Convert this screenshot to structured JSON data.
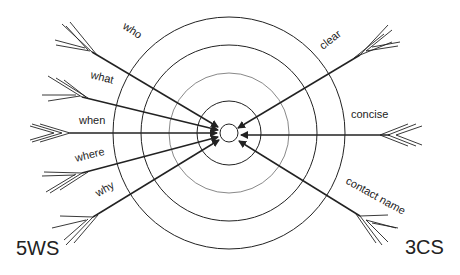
{
  "diagram": {
    "left_group_label": "5WS",
    "right_group_label": "3CS",
    "left_arrows": [
      {
        "label": "who"
      },
      {
        "label": "what"
      },
      {
        "label": "when"
      },
      {
        "label": "where"
      },
      {
        "label": "why"
      }
    ],
    "right_arrows": [
      {
        "label": "clear"
      },
      {
        "label": "concise"
      },
      {
        "label": "contact name"
      }
    ],
    "target_rings": 5,
    "colors": {
      "line": "#222222",
      "background": "#ffffff"
    }
  }
}
